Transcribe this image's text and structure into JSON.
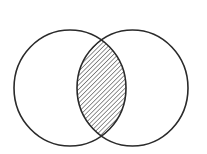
{
  "diagram": {
    "type": "venn",
    "sets": [
      {
        "id": "left",
        "cx": 70,
        "cy": 88,
        "rx": 56,
        "ry": 58
      },
      {
        "id": "right",
        "cx": 132.5,
        "cy": 88,
        "rx": 55.5,
        "ry": 58
      }
    ],
    "shaded_region": "intersection",
    "shading": "diagonal-hatch",
    "colors": {
      "stroke": "#2a2a2a",
      "hatch": "#3a3a3a",
      "background": "#ffffff"
    },
    "labels": []
  }
}
